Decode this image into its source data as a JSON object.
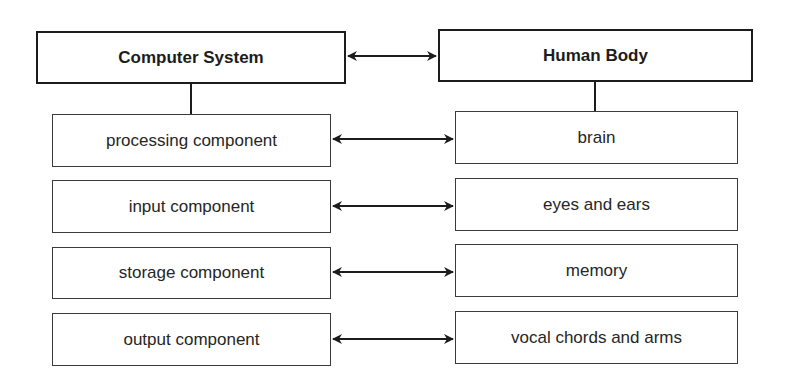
{
  "diagram": {
    "left": {
      "header": "Computer System",
      "items": [
        "processing component",
        "input component",
        "storage component",
        "output component"
      ]
    },
    "right": {
      "header": "Human Body",
      "items": [
        "brain",
        "eyes and ears",
        "memory",
        "vocal chords and arms"
      ]
    },
    "connector_style": "double-headed-arrow",
    "colors": {
      "stroke": "#1c1c1c",
      "background": "#ffffff"
    }
  }
}
